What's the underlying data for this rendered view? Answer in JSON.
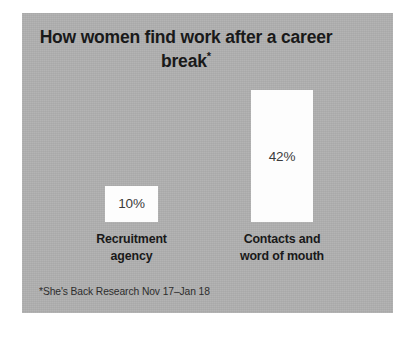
{
  "panel": {
    "background_color": "#b1b1b1",
    "outer_background_color": "#ffffff"
  },
  "title": {
    "line1": "How women find work after a",
    "line2": "career break",
    "footnote_marker": "*"
  },
  "footnote": {
    "text": "*She's Back Research Nov 17–Jan 18"
  },
  "chart_data": {
    "type": "bar",
    "title": "How women find work after a career break*",
    "xlabel": "",
    "ylabel": "",
    "ylim": [
      0,
      50
    ],
    "grid": false,
    "legend": "none",
    "value_suffix": "%",
    "bar_color": "#fdfdfd",
    "text_color": "#191919",
    "categories": [
      "Recruitment agency",
      "Contacts and word of mouth"
    ],
    "category_lines": [
      [
        "Recruitment",
        "agency"
      ],
      [
        "Contacts and",
        "word of mouth"
      ]
    ],
    "values": [
      10,
      42
    ],
    "value_labels": [
      "10%",
      "42%"
    ],
    "annotations": [
      "*She's Back Research Nov 17–Jan 18"
    ]
  }
}
